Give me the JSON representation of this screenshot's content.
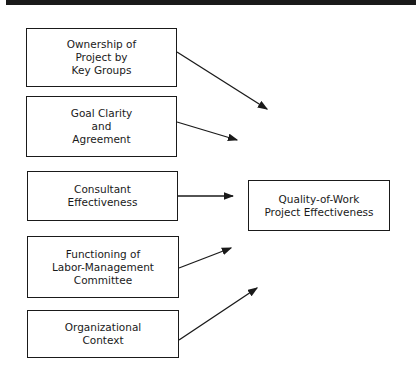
{
  "diagram": {
    "factors": [
      {
        "label": "Ownership of\nProject by\nKey Groups"
      },
      {
        "label": "Goal Clarity\nand\nAgreement"
      },
      {
        "label": "Consultant\nEffectiveness"
      },
      {
        "label": "Functioning of\nLabor-Management\nCommittee"
      },
      {
        "label": "Organizational\nContext"
      }
    ],
    "outcome": {
      "label": "Quality-of-Work\nProject Effectiveness"
    },
    "colors": {
      "line": "#1a1a1a",
      "background": "#ffffff"
    }
  }
}
